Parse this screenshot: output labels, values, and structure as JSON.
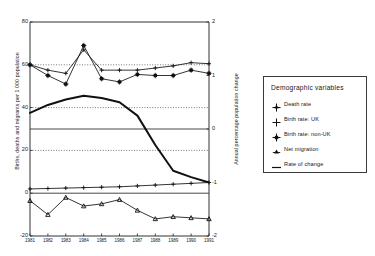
{
  "chart_data": {
    "type": "line",
    "title": "",
    "xlabel": "",
    "ylabel": "Births, deaths and migrants per 1 000 population",
    "y2label": "Annual percentage population change",
    "x": [
      "1981",
      "1982",
      "1983",
      "1984",
      "1985",
      "1986",
      "1987",
      "1988",
      "1989",
      "1990",
      "1991"
    ],
    "ylim": [
      -20,
      80
    ],
    "yticks": [
      "80",
      "60",
      "40",
      "20",
      "0",
      "-20"
    ],
    "y2lim": [
      -2,
      2
    ],
    "y2ticks": [
      "2",
      "1",
      "0",
      "-1",
      "-2"
    ],
    "grid": "dotted horizontal gridlines at 60, 40, 20 and solid line at 0",
    "legend_position": "right-outside",
    "series": [
      {
        "name": "Death rate",
        "marker": "plus",
        "axis": "left",
        "values": [
          2,
          2.2,
          2.4,
          2.6,
          2.8,
          3.0,
          3.4,
          3.8,
          4.2,
          4.6,
          5.0
        ]
      },
      {
        "name": "Birth rate: UK",
        "marker": "plus",
        "axis": "left",
        "values": [
          60,
          57.5,
          56,
          67,
          57.5,
          57.5,
          57.5,
          58.5,
          59.5,
          61,
          60.5
        ]
      },
      {
        "name": "Birth rate: non-UK",
        "marker": "star",
        "axis": "left",
        "values": [
          60,
          55,
          51,
          69,
          53.5,
          52,
          55.5,
          55,
          55,
          57.5,
          56
        ]
      },
      {
        "name": "Net migration",
        "marker": "triangle",
        "axis": "left",
        "values": [
          -3.5,
          -10,
          -2,
          -6,
          -5,
          -3,
          -8,
          -12,
          -11,
          -11.5,
          -12
        ]
      },
      {
        "name": "Rate of change",
        "marker": "line",
        "axis": "right",
        "values": [
          0.3,
          0.45,
          0.55,
          0.62,
          0.58,
          0.5,
          0.25,
          -0.3,
          -0.78,
          -0.9,
          -1.0
        ]
      }
    ]
  },
  "axes": {
    "left": {
      "label": "Births, deaths and migrants per 1 000 population",
      "ticks": [
        "80",
        "60",
        "40",
        "20",
        "0",
        "-20"
      ]
    },
    "right": {
      "label": "Annual percentage population change",
      "ticks": [
        "2",
        "1",
        "0",
        "-1",
        "-2"
      ]
    },
    "x": {
      "ticks": [
        "1981",
        "1982",
        "1983",
        "1984",
        "1985",
        "1986",
        "1987",
        "1988",
        "1989",
        "1990",
        "1991"
      ]
    }
  },
  "legend": {
    "title": "Demographic variables",
    "items": [
      {
        "label": "Death rate",
        "icon": "plus-marker-icon"
      },
      {
        "label": "Birth rate: UK",
        "icon": "plus-marker-icon"
      },
      {
        "label": "Birth rate: non-UK",
        "icon": "star-marker-icon"
      },
      {
        "label": "Net migration",
        "icon": "triangle-marker-icon"
      },
      {
        "label": "Rate of change",
        "icon": "line-marker-icon"
      }
    ]
  },
  "colors": {
    "ink": "#1a1a1a",
    "background": "#ffffff",
    "grid": "#4a4a4a"
  }
}
